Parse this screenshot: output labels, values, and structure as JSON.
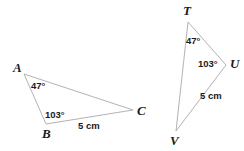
{
  "figure": {
    "background_color": "#ffffff",
    "stroke_color": "#b3b3b3",
    "text_color": "#1a1a1a",
    "stroke_width": 1,
    "triangles": [
      {
        "name": "triangle-abc",
        "vertices": [
          {
            "label": "A",
            "x": 24,
            "y": 74
          },
          {
            "label": "B",
            "x": 46,
            "y": 124
          },
          {
            "label": "C",
            "x": 133,
            "y": 110
          }
        ],
        "vertex_labels": [
          {
            "label": "A",
            "x": 13,
            "y": 61
          },
          {
            "label": "B",
            "x": 42,
            "y": 127
          },
          {
            "label": "C",
            "x": 137,
            "y": 104
          }
        ],
        "angle_labels": [
          {
            "text": "47°",
            "x": 31,
            "y": 81
          },
          {
            "text": "103°",
            "x": 45,
            "y": 110
          }
        ],
        "side_labels": [
          {
            "text": "5 cm",
            "x": 78,
            "y": 121
          }
        ]
      },
      {
        "name": "triangle-tuv",
        "vertices": [
          {
            "label": "T",
            "x": 188,
            "y": 22
          },
          {
            "label": "U",
            "x": 226,
            "y": 65
          },
          {
            "label": "V",
            "x": 176,
            "y": 131
          }
        ],
        "vertex_labels": [
          {
            "label": "T",
            "x": 183,
            "y": 4
          },
          {
            "label": "U",
            "x": 230,
            "y": 57
          },
          {
            "label": "V",
            "x": 170,
            "y": 134
          }
        ],
        "angle_labels": [
          {
            "text": "47°",
            "x": 186,
            "y": 36
          },
          {
            "text": "103°",
            "x": 198,
            "y": 59
          }
        ],
        "side_labels": [
          {
            "text": "5 cm",
            "x": 200,
            "y": 91
          }
        ]
      }
    ],
    "labels": {
      "a_vertex": "A",
      "b_vertex": "B",
      "c_vertex": "C",
      "t_vertex": "T",
      "u_vertex": "U",
      "v_vertex": "V",
      "abc_angle_a": "47°",
      "abc_angle_b": "103°",
      "abc_side_bc": "5 cm",
      "tuv_angle_t": "47°",
      "tuv_angle_u": "103°",
      "tuv_side_uv": "5 cm"
    }
  }
}
